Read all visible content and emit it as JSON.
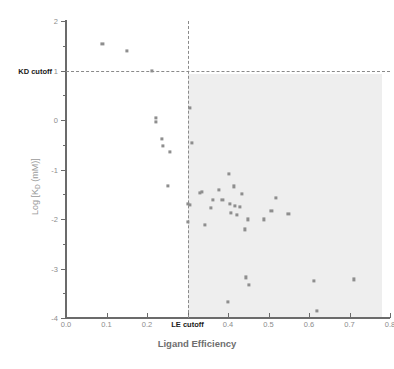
{
  "chart_data": {
    "type": "scatter",
    "title": "",
    "xlabel": "Ligand Efficiency",
    "ylabel": "Log [KD (mM)]",
    "ylabel_main": "Log [K",
    "ylabel_sub": "D",
    "ylabel_tail": " (mM)]",
    "xlim": [
      0.0,
      0.8
    ],
    "ylim": [
      -4,
      2
    ],
    "grid": false,
    "legend": null,
    "xticks": [
      0.0,
      0.1,
      0.2,
      0.3,
      0.4,
      0.5,
      0.6,
      0.7,
      0.8
    ],
    "xtick_labels": [
      "0.0",
      "0.1",
      "0.2",
      "",
      "0.4",
      "0.5",
      "0.6",
      "0.7",
      "0.8"
    ],
    "yticks": [
      2,
      1,
      0,
      -1,
      -2,
      -3,
      -4
    ],
    "ytick_labels": [
      "2",
      "1",
      "0",
      "-1",
      "-2",
      "-3",
      "-4"
    ],
    "y_minor_ticks": [
      1.5,
      0.5,
      -0.5,
      -1.5,
      -2.5,
      -3.5
    ],
    "annotations": [
      {
        "name": "kd-cutoff",
        "label": "KD cutoff",
        "axis": "y",
        "value": 1,
        "style": "dashed"
      },
      {
        "name": "le-cutoff",
        "label": "LE  cutoff",
        "axis": "x",
        "value": 0.3,
        "style": "dashed"
      }
    ],
    "shaded_region": {
      "x_range": [
        0.3,
        0.78
      ],
      "y_range": [
        -4,
        0.93
      ],
      "color": "#eeeeee"
    },
    "marker": {
      "shape": "square",
      "color": "#8e8e8e",
      "size": 3.2
    },
    "points": [
      [
        0.09,
        1.53
      ],
      [
        0.15,
        1.4
      ],
      [
        0.212,
        1.0
      ],
      [
        0.222,
        0.04
      ],
      [
        0.221,
        -0.04
      ],
      [
        0.236,
        -0.39
      ],
      [
        0.24,
        -0.53
      ],
      [
        0.257,
        -0.65
      ],
      [
        0.252,
        -1.33
      ],
      [
        0.305,
        0.24
      ],
      [
        0.31,
        -0.46
      ],
      [
        0.3,
        -1.69
      ],
      [
        0.306,
        -1.72
      ],
      [
        0.302,
        -2.06
      ],
      [
        0.336,
        -1.45
      ],
      [
        0.33,
        -1.48
      ],
      [
        0.343,
        -2.12
      ],
      [
        0.362,
        -1.61
      ],
      [
        0.358,
        -1.77
      ],
      [
        0.378,
        -1.42
      ],
      [
        0.386,
        -1.61
      ],
      [
        0.402,
        -1.09
      ],
      [
        0.404,
        -1.69
      ],
      [
        0.407,
        -1.87
      ],
      [
        0.4,
        -3.68
      ],
      [
        0.415,
        -1.34
      ],
      [
        0.418,
        -1.74
      ],
      [
        0.421,
        -1.91
      ],
      [
        0.435,
        -1.49
      ],
      [
        0.43,
        -1.76
      ],
      [
        0.441,
        -2.21
      ],
      [
        0.444,
        -3.18
      ],
      [
        0.45,
        -2.01
      ],
      [
        0.452,
        -3.33
      ],
      [
        0.488,
        -2.01
      ],
      [
        0.507,
        -1.84
      ],
      [
        0.518,
        -1.57
      ],
      [
        0.549,
        -1.9
      ],
      [
        0.612,
        -3.25
      ],
      [
        0.619,
        -3.85
      ],
      [
        0.71,
        -3.22
      ]
    ]
  }
}
